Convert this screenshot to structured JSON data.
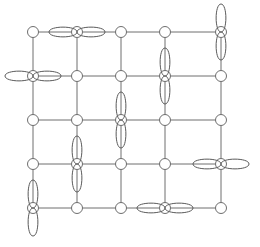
{
  "figure": {
    "width": 260,
    "height": 247,
    "background_color": "#ffffff"
  },
  "lattice": {
    "rows": 5,
    "cols": 5,
    "spacing_x": 47,
    "spacing_y": 44,
    "origin_x": 33,
    "origin_y": 32,
    "line_color": "#6e6e6e",
    "line_width": 1,
    "node_radius": 5.5,
    "node_fill": "#ffffff",
    "node_stroke": "#6e6e6e",
    "columns_x": [
      33,
      77,
      121,
      165,
      221
    ],
    "rows_y": [
      32,
      76,
      120,
      164,
      208
    ]
  },
  "orbitals": {
    "color": "#5a5a5a",
    "stroke_width": 1,
    "lobe_length": 28,
    "lobe_width": 13,
    "items": [
      {
        "name": "orbital-r1c2-horizontal",
        "row": 1,
        "col": 2,
        "cx": 77,
        "cy": 32,
        "orientation": "horizontal"
      },
      {
        "name": "orbital-r1c5-vertical",
        "row": 1,
        "col": 5,
        "cx": 221,
        "cy": 32,
        "orientation": "vertical"
      },
      {
        "name": "orbital-r2c1-horizontal",
        "row": 2,
        "col": 1,
        "cx": 33,
        "cy": 76,
        "orientation": "horizontal"
      },
      {
        "name": "orbital-r2c4-vertical",
        "row": 2,
        "col": 4,
        "cx": 165,
        "cy": 76,
        "orientation": "vertical"
      },
      {
        "name": "orbital-r3c3-vertical",
        "row": 3,
        "col": 3,
        "cx": 121,
        "cy": 120,
        "orientation": "vertical"
      },
      {
        "name": "orbital-r4c2-vertical",
        "row": 4,
        "col": 2,
        "cx": 77,
        "cy": 164,
        "orientation": "vertical"
      },
      {
        "name": "orbital-r4c5-horizontal",
        "row": 4,
        "col": 5,
        "cx": 221,
        "cy": 164,
        "orientation": "horizontal"
      },
      {
        "name": "orbital-r5c1-vertical",
        "row": 5,
        "col": 1,
        "cx": 33,
        "cy": 208,
        "orientation": "vertical"
      },
      {
        "name": "orbital-r5c4-horizontal",
        "row": 5,
        "col": 4,
        "cx": 165,
        "cy": 208,
        "orientation": "horizontal"
      }
    ]
  }
}
